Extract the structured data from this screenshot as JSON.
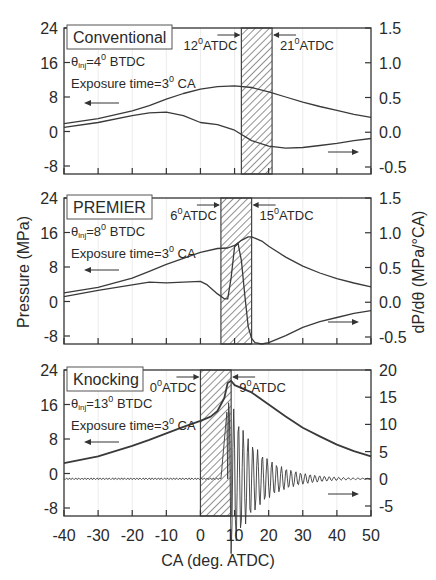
{
  "figure": {
    "y_left_label": "Pressure (MPa)",
    "y_right_label": "dP/dθ (MPa/°CA)",
    "x_label": "CA (deg. ATDC)",
    "x_ticks": [
      "-40",
      "-30",
      "-20",
      "-10",
      "0",
      "10",
      "20",
      "30",
      "40",
      "50"
    ]
  },
  "chart_data": [
    {
      "type": "line",
      "title": "Conventional",
      "annotations": [
        "θinj=4° BTDC",
        "Exposure time=3° CA",
        "12°ATDC",
        "21°ATDC"
      ],
      "injection": {
        "theta_inj_deg_btdc": 4,
        "exposure_time_deg_ca": 3
      },
      "shaded_window": [
        12,
        21
      ],
      "xlabel": "CA (deg. ATDC)",
      "xlim": [
        -40,
        50
      ],
      "ylabel": "Pressure (MPa)",
      "ylim": [
        -8,
        24
      ],
      "yticks": [
        -8,
        0,
        8,
        16,
        24
      ],
      "y2label": "dP/dθ (MPa/°CA)",
      "y2lim": [
        -0.6,
        1.5
      ],
      "y2ticks": [
        -0.5,
        0.0,
        0.5,
        1.0,
        1.5
      ],
      "series": [
        {
          "name": "Pressure",
          "axis": "left",
          "x": [
            -40,
            -30,
            -20,
            -15,
            -10,
            -5,
            0,
            5,
            10,
            15,
            20,
            25,
            30,
            35,
            40,
            45,
            50
          ],
          "y": [
            1.8,
            3.0,
            4.8,
            6.0,
            7.5,
            8.8,
            9.8,
            10.4,
            10.6,
            10.2,
            9.2,
            8.0,
            6.8,
            5.8,
            4.9,
            4.0,
            3.3
          ]
        },
        {
          "name": "dP/dθ",
          "axis": "right",
          "x": [
            -40,
            -30,
            -20,
            -15,
            -10,
            -5,
            0,
            5,
            10,
            15,
            20,
            25,
            30,
            35,
            40,
            45,
            50
          ],
          "y": [
            0.07,
            0.14,
            0.24,
            0.28,
            0.29,
            0.24,
            0.14,
            0.11,
            0.03,
            -0.12,
            -0.2,
            -0.23,
            -0.22,
            -0.19,
            -0.16,
            -0.12,
            -0.09
          ]
        }
      ]
    },
    {
      "type": "line",
      "title": "PREMIER",
      "annotations": [
        "θinj=8° BTDC",
        "Exposure time=3° CA",
        "6°ATDC",
        "15°ATDC"
      ],
      "injection": {
        "theta_inj_deg_btdc": 8,
        "exposure_time_deg_ca": 3
      },
      "shaded_window": [
        6,
        15
      ],
      "xlabel": "CA (deg. ATDC)",
      "xlim": [
        -40,
        50
      ],
      "ylabel": "Pressure (MPa)",
      "ylim": [
        -8,
        24
      ],
      "yticks": [
        -8,
        0,
        8,
        16,
        24
      ],
      "y2label": "dP/dθ (MPa/°CA)",
      "y2lim": [
        -0.6,
        1.5
      ],
      "y2ticks": [
        -0.5,
        0.0,
        0.5,
        1.0,
        1.5
      ],
      "series": [
        {
          "name": "Pressure",
          "axis": "left",
          "x": [
            -40,
            -30,
            -20,
            -15,
            -10,
            -5,
            0,
            5,
            8,
            10,
            12,
            14,
            15,
            18,
            20,
            25,
            30,
            35,
            40,
            45,
            50
          ],
          "y": [
            2.0,
            3.3,
            5.4,
            7.0,
            8.6,
            10.0,
            11.4,
            12.3,
            12.4,
            13.0,
            14.2,
            15.0,
            15.0,
            14.0,
            12.8,
            10.3,
            8.2,
            6.6,
            5.3,
            4.3,
            3.4
          ]
        },
        {
          "name": "dP/dθ",
          "axis": "right",
          "x": [
            -40,
            -30,
            -20,
            -15,
            -10,
            -5,
            0,
            2,
            5,
            7,
            8,
            9,
            10,
            11,
            12,
            13,
            14,
            15,
            16,
            18,
            20,
            25,
            30,
            35,
            40,
            45,
            50
          ],
          "y": [
            0.08,
            0.17,
            0.25,
            0.29,
            0.28,
            0.29,
            0.3,
            0.25,
            0.12,
            0.05,
            0.05,
            0.35,
            0.8,
            0.85,
            0.6,
            0.1,
            -0.35,
            -0.52,
            -0.58,
            -0.6,
            -0.58,
            -0.48,
            -0.36,
            -0.28,
            -0.22,
            -0.16,
            -0.12
          ]
        }
      ]
    },
    {
      "type": "line",
      "title": "Knocking",
      "annotations": [
        "θinj=13° BTDC",
        "Exposure time=3° CA",
        "0°ATDC",
        "9°ATDC"
      ],
      "injection": {
        "theta_inj_deg_btdc": 13,
        "exposure_time_deg_ca": 3
      },
      "shaded_window": [
        0,
        9
      ],
      "xlabel": "CA (deg. ATDC)",
      "xlim": [
        -40,
        50
      ],
      "ylabel": "Pressure (MPa)",
      "ylim": [
        -8,
        24
      ],
      "yticks": [
        -8,
        0,
        8,
        16,
        24
      ],
      "y2label": "dP/dθ",
      "y2lim": [
        -6,
        20
      ],
      "y2ticks": [
        -5,
        0,
        5,
        10,
        15,
        20
      ],
      "series": [
        {
          "name": "Pressure",
          "axis": "left",
          "x": [
            -40,
            -30,
            -20,
            -15,
            -10,
            -5,
            0,
            3,
            5,
            7,
            8,
            9,
            10,
            15,
            20,
            25,
            30,
            35,
            40,
            45,
            50
          ],
          "y": [
            2.4,
            4.0,
            6.4,
            7.8,
            9.3,
            10.8,
            12.2,
            13.2,
            14.5,
            17.5,
            21.0,
            21.5,
            20.5,
            18.8,
            16.0,
            13.2,
            10.6,
            8.6,
            6.7,
            5.2,
            4.0
          ]
        },
        {
          "name": "dP/dθ",
          "axis": "right",
          "x": [
            -40,
            -20,
            0,
            5,
            6,
            7,
            7.5,
            8,
            9,
            10,
            15,
            20,
            30,
            40,
            50
          ],
          "y": [
            0.0,
            0.0,
            0.0,
            0.0,
            2.0,
            6.0,
            15.0,
            10.0,
            6.0,
            4.0,
            3.0,
            1.5,
            0.6,
            0.2,
            0.0
          ],
          "note": "values describe envelope of a decaying oscillation after ~8° ATDC"
        }
      ]
    }
  ]
}
